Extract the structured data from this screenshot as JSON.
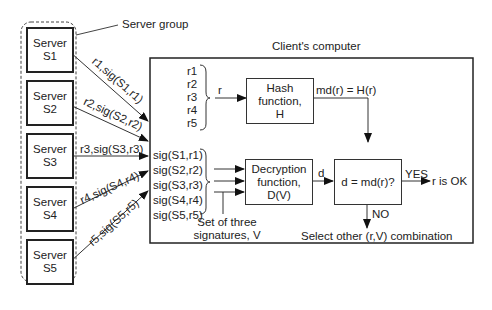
{
  "server_group": {
    "label": "Server group",
    "servers": [
      {
        "line1": "Server",
        "line2": "S1"
      },
      {
        "line1": "Server",
        "line2": "S2"
      },
      {
        "line1": "Server",
        "line2": "S3"
      },
      {
        "line1": "Server",
        "line2": "S4"
      },
      {
        "line1": "Server",
        "line2": "S5"
      }
    ]
  },
  "messages": [
    "r1,sig(S1,r1)",
    "r2,sig(S2,r2)",
    "r3,sig(S3,r3)",
    "r4,sig(S4,r4)",
    "r5,sig(S5,r5)"
  ],
  "client": {
    "title": "Client's computer",
    "r_values": [
      "r1",
      "r2",
      "r3",
      "r4",
      "r5"
    ],
    "r_arrow_label": "r",
    "hash_box": {
      "line1": "Hash",
      "line2": "function,",
      "line3": "H"
    },
    "hash_output": "md(r) = H(r)",
    "signatures": [
      "sig(S1,r1)",
      "sig(S2,r2)",
      "sig(S3,r3)",
      "sig(S4,r4)",
      "sig(S5,r5)"
    ],
    "sig_set_label": {
      "line1": "Set of three",
      "line2": "signatures, V"
    },
    "decrypt_box": {
      "line1": "Decryption",
      "line2": "function,",
      "line3": "D(V)"
    },
    "decrypt_output": "d",
    "compare_box": "d = md(r)?",
    "yes_label": "YES",
    "yes_result": "r is OK",
    "no_label": "NO",
    "no_result": "Select other (r,V) combination"
  }
}
